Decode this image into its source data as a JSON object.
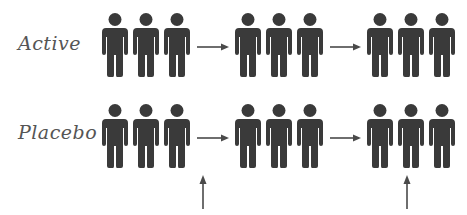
{
  "rows": [
    {
      "label": "Active",
      "groups": [
        {
          "count": 3
        },
        {
          "count": 3
        },
        {
          "count": 3
        }
      ]
    },
    {
      "label": "Placebo",
      "groups": [
        {
          "count": 3
        },
        {
          "count": 3
        },
        {
          "count": 3
        }
      ]
    }
  ],
  "icons": {
    "person": "person-icon",
    "arrow": "arrow-right-icon",
    "marker": "arrow-up-icon"
  },
  "colors": {
    "figure": "#3a3a3a",
    "arrow": "#4a4a4a",
    "text": "#555555"
  }
}
